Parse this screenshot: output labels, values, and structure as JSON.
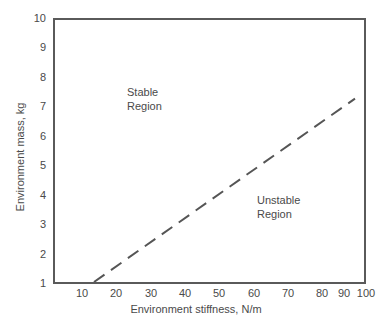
{
  "chart_data": {
    "type": "line",
    "title": "",
    "subtitle": "",
    "xlabel": "Environment stiffness, N/m",
    "ylabel": "Environment mass, kg",
    "xlim": [
      0,
      103
    ],
    "ylim": [
      1,
      10
    ],
    "xticks": [
      10,
      20,
      30,
      40,
      50,
      60,
      70,
      80,
      90,
      100
    ],
    "xticklabels": [
      "10",
      "20",
      "30",
      "40",
      "50",
      "60",
      "70",
      "80",
      "90",
      "100"
    ],
    "yticks": [
      1,
      2,
      3,
      4,
      5,
      6,
      7,
      8,
      9,
      10
    ],
    "yticklabels": [
      "1",
      "2",
      "3",
      "4",
      "5",
      "6",
      "7",
      "8",
      "9",
      "10"
    ],
    "grid": false,
    "legend": null,
    "legend_position": "none",
    "series": [
      {
        "name": "Stability boundary",
        "style": "dashed",
        "color": "#555555",
        "x": [
          13,
          100
        ],
        "y": [
          1,
          7.3
        ]
      }
    ],
    "annotations": [
      {
        "id": "stable",
        "lines": [
          "Stable",
          "Region"
        ],
        "x": 31,
        "y": 7.6
      },
      {
        "id": "unstable",
        "lines": [
          "Unstable",
          "Region"
        ],
        "x": 69,
        "y": 4.0
      }
    ]
  },
  "axes": {
    "frame_color": "#5a5a5a",
    "background": "#ffffff",
    "text_color": "#4a4a4a"
  }
}
